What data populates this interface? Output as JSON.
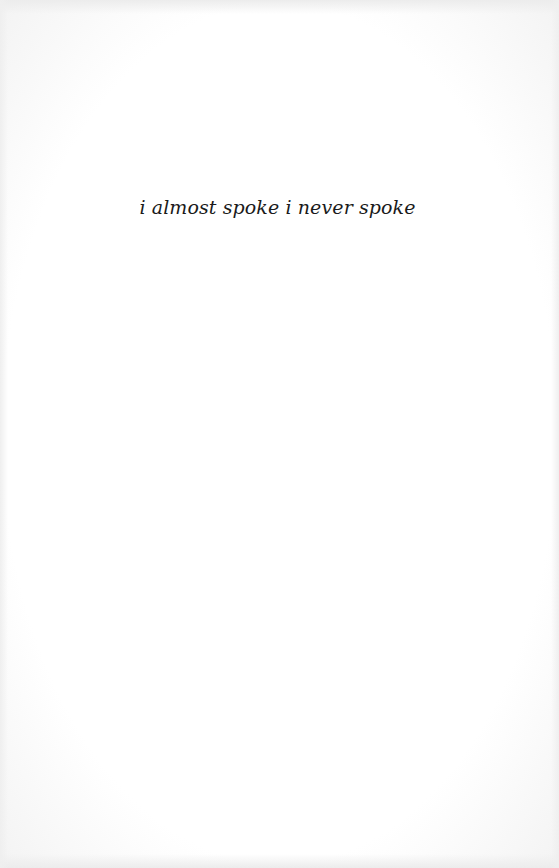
{
  "page": {
    "background": "#fdfdfd",
    "text_color": "#1a1a1a"
  },
  "content": {
    "line": "i almost spoke i never spoke"
  }
}
